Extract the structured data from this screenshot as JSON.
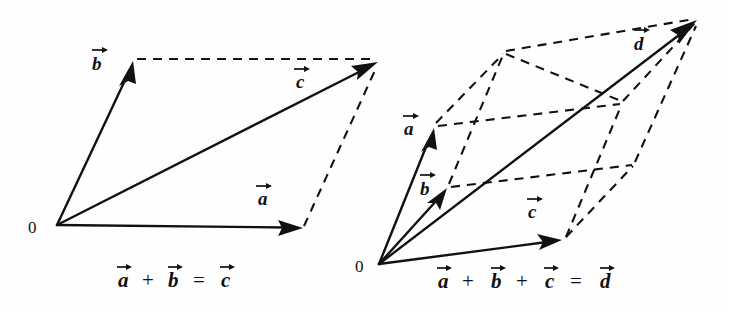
{
  "figure": {
    "name": "vector-addition-parallelogram-figures",
    "background_color": "#fefefe",
    "ink_color": "#111111",
    "left_diagram": {
      "caption_terms": [
        "a",
        "+",
        "b",
        "=",
        "c"
      ],
      "origin_label": "0",
      "vectors": [
        {
          "name": "a",
          "label": "a",
          "from": [
            57,
            225
          ],
          "to": [
            303,
            228
          ],
          "style": "solid"
        },
        {
          "name": "b",
          "label": "b",
          "from": [
            57,
            225
          ],
          "to": [
            133,
            61
          ],
          "style": "solid"
        },
        {
          "name": "c",
          "label": "c",
          "from": [
            57,
            225
          ],
          "to": [
            378,
            62
          ],
          "style": "solid"
        }
      ],
      "construction_lines": [
        {
          "name": "b-to-c-top",
          "from": [
            133,
            59
          ],
          "to": [
            378,
            59
          ],
          "style": "dashed"
        },
        {
          "name": "a-to-c-right",
          "from": [
            303,
            228
          ],
          "to": [
            378,
            64
          ],
          "style": "dashed"
        }
      ],
      "label_positions": {
        "a": [
          258,
          205
        ],
        "b": [
          92,
          70
        ],
        "c": [
          296,
          88
        ],
        "origin": [
          28,
          233
        ]
      }
    },
    "right_diagram": {
      "caption_terms": [
        "a",
        "+",
        "b",
        "+",
        "c",
        "=",
        "d"
      ],
      "origin_label": "0",
      "vectors": [
        {
          "name": "a",
          "label": "a",
          "from": [
            379,
            264
          ],
          "to": [
            434,
            128
          ],
          "style": "solid"
        },
        {
          "name": "b",
          "label": "b",
          "from": [
            379,
            264
          ],
          "to": [
            447,
            188
          ],
          "style": "solid"
        },
        {
          "name": "c",
          "label": "c",
          "from": [
            379,
            264
          ],
          "to": [
            562,
            240
          ],
          "style": "solid"
        },
        {
          "name": "d",
          "label": "d",
          "from": [
            379,
            264
          ],
          "to": [
            697,
            20
          ],
          "style": "solid"
        }
      ],
      "construction_lines": [
        {
          "name": "a-to-ab",
          "from": [
            434,
            124
          ],
          "to": [
            504,
            52
          ],
          "style": "dashed"
        },
        {
          "name": "b-to-ab",
          "from": [
            447,
            185
          ],
          "to": [
            504,
            52
          ],
          "style": "dashed"
        },
        {
          "name": "ab-to-abc-top",
          "from": [
            504,
            52
          ],
          "to": [
            697,
            18
          ],
          "style": "dashed"
        },
        {
          "name": "a-to-ac",
          "from": [
            436,
            127
          ],
          "to": [
            622,
            103
          ],
          "style": "dashed"
        },
        {
          "name": "b-to-bc",
          "from": [
            449,
            187
          ],
          "to": [
            634,
            164
          ],
          "style": "dashed"
        },
        {
          "name": "c-to-bc",
          "from": [
            564,
            239
          ],
          "to": [
            634,
            164
          ],
          "style": "dashed"
        },
        {
          "name": "c-to-ac-vertical",
          "from": [
            564,
            239
          ],
          "to": [
            622,
            103
          ],
          "style": "dashed"
        },
        {
          "name": "ac-to-abc",
          "from": [
            622,
            103
          ],
          "to": [
            697,
            22
          ],
          "style": "dashed"
        },
        {
          "name": "bc-to-abc",
          "from": [
            634,
            164
          ],
          "to": [
            697,
            24
          ],
          "style": "dashed"
        },
        {
          "name": "ab-to-ac-edge",
          "from": [
            504,
            52
          ],
          "to": [
            622,
            103
          ],
          "style": "dashed"
        }
      ],
      "label_positions": {
        "a": [
          404,
          135
        ],
        "b": [
          420,
          195
        ],
        "c": [
          528,
          218
        ],
        "d": [
          634,
          50
        ],
        "origin": [
          355,
          272
        ]
      }
    },
    "left_caption_x": 118,
    "right_caption_x": 438,
    "caption_baseline_y": 287
  }
}
